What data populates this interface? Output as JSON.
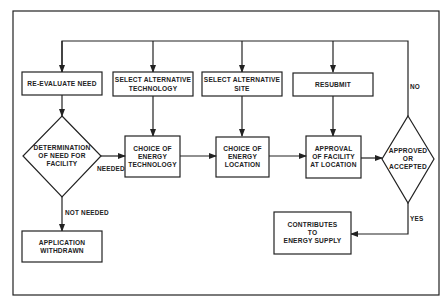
{
  "diagram": {
    "type": "flowchart",
    "nodes": {
      "reevaluate": {
        "lines": [
          "RE-EVALUATE NEED"
        ]
      },
      "select_tech": {
        "lines": [
          "SELECT ALTERNATIVE",
          "TECHNOLOGY"
        ]
      },
      "select_site": {
        "lines": [
          "SELECT ALTERNATIVE",
          "SITE"
        ]
      },
      "resubmit": {
        "lines": [
          "RESUBMIT"
        ]
      },
      "determination": {
        "lines": [
          "DETERMINATION",
          "OF NEED FOR",
          "FACILITY"
        ]
      },
      "choice_tech": {
        "lines": [
          "CHOICE OF",
          "ENERGY",
          "TECHNOLOGY"
        ]
      },
      "choice_location": {
        "lines": [
          "CHOICE OF",
          "ENERGY",
          "LOCATION"
        ]
      },
      "approval": {
        "lines": [
          "APPROVAL",
          "OF FACILITY",
          "AT LOCATION"
        ]
      },
      "approved": {
        "lines": [
          "APPROVED",
          "OR",
          "ACCEPTED"
        ]
      },
      "withdrawn": {
        "lines": [
          "APPLICATION",
          "WITHDRAWN"
        ]
      },
      "contributes": {
        "lines": [
          "CONTRIBUTES",
          "TO",
          "ENERGY SUPPLY"
        ]
      }
    },
    "edge_labels": {
      "needed": "NEEDED",
      "not_needed": "NOT NEEDED",
      "yes": "YES",
      "no": "NO"
    }
  }
}
